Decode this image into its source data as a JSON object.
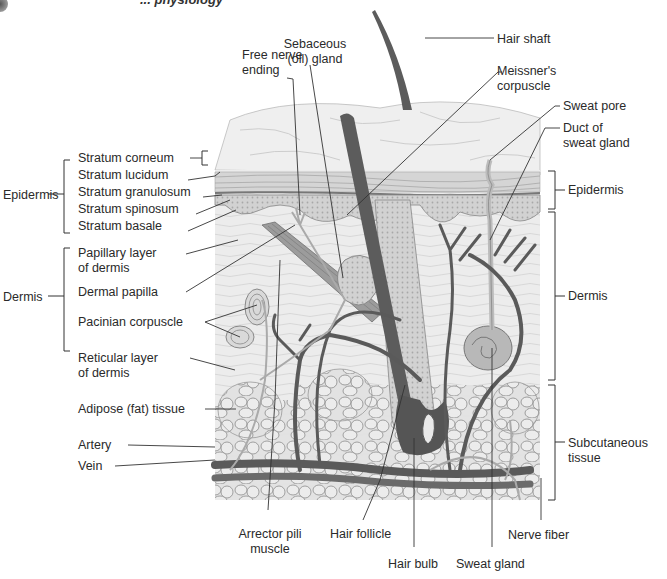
{
  "figure": {
    "header_fragment": "... physiology"
  },
  "left_labels": {
    "epidermis_group": "Epidermis",
    "dermis_group": "Dermis",
    "stratum_corneum": "Stratum corneum",
    "stratum_lucidum": "Stratum lucidum",
    "stratum_granulosum": "Stratum granulosum",
    "stratum_spinosum": "Stratum spinosum",
    "stratum_basale": "Stratum basale",
    "papillary_layer_1": "Papillary layer",
    "papillary_layer_2": "of dermis",
    "dermal_papilla": "Dermal papilla",
    "pacinian_corpuscle": "Pacinian corpuscle",
    "reticular_layer_1": "Reticular layer",
    "reticular_layer_2": "of dermis",
    "adipose_tissue": "Adipose (fat) tissue",
    "artery": "Artery",
    "vein": "Vein"
  },
  "top_labels": {
    "free_nerve_1": "Free nerve",
    "free_nerve_2": "ending",
    "sebaceous_1": "Sebaceous",
    "sebaceous_2": "(oil) gland"
  },
  "right_labels": {
    "hair_shaft": "Hair shaft",
    "meissner_1": "Meissner's",
    "meissner_2": "corpuscle",
    "sweat_pore": "Sweat pore",
    "duct_1": "Duct of",
    "duct_2": "sweat gland",
    "epidermis": "Epidermis",
    "dermis": "Dermis",
    "subcutaneous_1": "Subcutaneous",
    "subcutaneous_2": "tissue"
  },
  "bottom_labels": {
    "arrector_1": "Arrector pili",
    "arrector_2": "muscle",
    "hair_follicle": "Hair follicle",
    "hair_bulb": "Hair bulb",
    "sweat_gland": "Sweat gland",
    "nerve_fiber": "Nerve fiber"
  },
  "colors": {
    "vessel": "#5a5a5a",
    "tissue_bg": "#e6e6e6",
    "epidermis": "#cfcfcf",
    "fat": "#d8d8d8",
    "line": "#333333"
  }
}
